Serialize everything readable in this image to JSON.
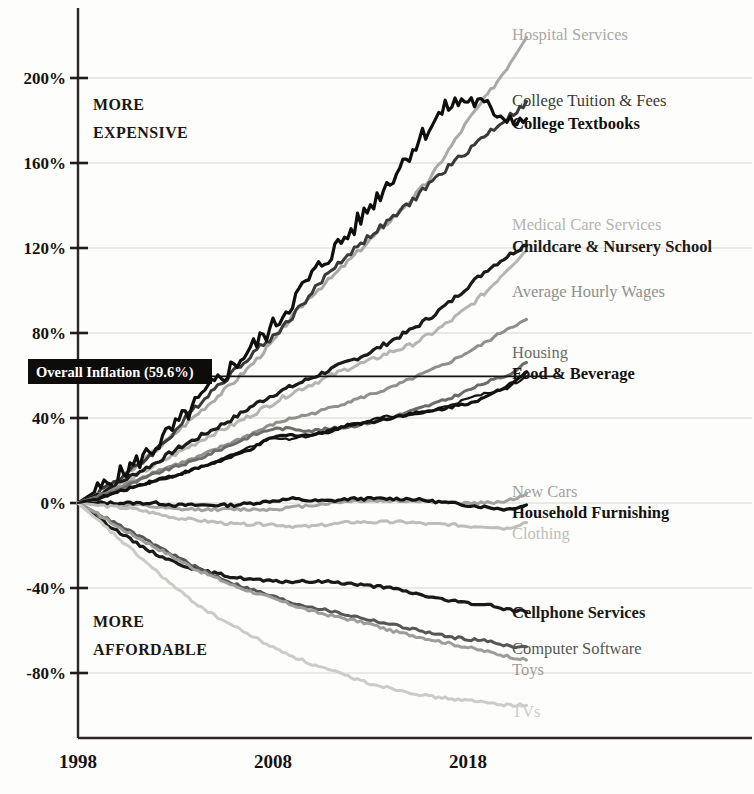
{
  "chart_data": {
    "type": "line",
    "title": "",
    "subtitle": "",
    "xlabel": "",
    "ylabel": "",
    "xlim": [
      1998,
      2021
    ],
    "ylim": [
      -100,
      225
    ],
    "grid": true,
    "legend_position": "right-inline-labels",
    "x_ticks": [
      "1998",
      "2008",
      "2018"
    ],
    "x_tick_values": [
      1998,
      2008,
      2018
    ],
    "y_ticks": [
      "200%",
      "160%",
      "120%",
      "80%",
      "40%",
      "0%",
      "-40%",
      "-80%"
    ],
    "y_tick_values": [
      200,
      160,
      120,
      80,
      40,
      0,
      -40,
      -80
    ],
    "annotations": [
      {
        "name": "more-expensive",
        "text_line1": "MORE",
        "text_line2": "EXPENSIVE"
      },
      {
        "name": "more-affordable",
        "text_line1": "MORE",
        "text_line2": "AFFORDABLE"
      },
      {
        "name": "overall-inflation",
        "text": "Overall Inflation (59.6%)",
        "value": 59.6
      }
    ],
    "x": [
      1998,
      1999,
      2000,
      2001,
      2002,
      2003,
      2004,
      2005,
      2006,
      2007,
      2008,
      2009,
      2010,
      2011,
      2012,
      2013,
      2014,
      2015,
      2016,
      2017,
      2018,
      2019,
      2020,
      2021
    ],
    "series": [
      {
        "name": "Hospital Services",
        "label": "Hospital Services",
        "color": "#a9a9a6",
        "weight": "normal",
        "end_value": 220,
        "values": [
          0,
          5,
          10,
          17,
          25,
          33,
          41,
          49,
          57,
          66,
          76,
          88,
          98,
          106,
          115,
          124,
          133,
          142,
          152,
          166,
          180,
          192,
          205,
          220
        ]
      },
      {
        "name": "College Tuition & Fees",
        "label": "College Tuition & Fees",
        "color": "#3c3a38",
        "weight": "normal",
        "end_value": 188,
        "values": [
          0,
          5,
          11,
          17,
          25,
          34,
          45,
          54,
          62,
          71,
          78,
          88,
          99,
          110,
          118,
          126,
          133,
          141,
          150,
          158,
          166,
          174,
          181,
          188
        ]
      },
      {
        "name": "College Textbooks",
        "label": "College Textbooks",
        "color": "#100f0e",
        "weight": "bold",
        "end_value": 180,
        "values": [
          0,
          6,
          12,
          19,
          27,
          36,
          46,
          56,
          65,
          74,
          83,
          95,
          107,
          118,
          128,
          140,
          152,
          165,
          177,
          187,
          190,
          186,
          182,
          180
        ]
      },
      {
        "name": "Medical Care Services",
        "label": "Medical Care Services",
        "color": "#b5b5b2",
        "weight": "normal",
        "end_value": 119,
        "values": [
          0,
          4,
          8,
          13,
          18,
          23,
          28,
          33,
          37,
          42,
          47,
          52,
          56,
          60,
          64,
          67,
          71,
          74,
          79,
          85,
          92,
          100,
          110,
          119
        ]
      },
      {
        "name": "Childcare & Nursery School",
        "label": "Childcare & Nursery School",
        "color": "#1d1b19",
        "weight": "bold",
        "end_value": 122,
        "values": [
          0,
          4,
          9,
          14,
          19,
          25,
          30,
          35,
          40,
          46,
          51,
          55,
          59,
          63,
          67,
          71,
          76,
          81,
          87,
          94,
          102,
          110,
          116,
          122
        ]
      },
      {
        "name": "Average Hourly Wages",
        "label": "Average Hourly Wages",
        "color": "#8f8f8c",
        "weight": "normal",
        "end_value": 86,
        "values": [
          0,
          3,
          7,
          11,
          15,
          18,
          21,
          25,
          29,
          33,
          37,
          40,
          42,
          45,
          48,
          51,
          54,
          58,
          62,
          66,
          71,
          76,
          82,
          86
        ]
      },
      {
        "name": "Housing",
        "label": "Housing",
        "color": "#6e6c69",
        "weight": "normal",
        "end_value": 66,
        "values": [
          0,
          3,
          6,
          10,
          14,
          17,
          20,
          24,
          28,
          32,
          35,
          35,
          34,
          35,
          36,
          38,
          40,
          43,
          46,
          49,
          53,
          57,
          60,
          66
        ]
      },
      {
        "name": "Food & Beverage",
        "label": "Food & Beverage",
        "color": "#141312",
        "weight": "bold",
        "end_value": 62,
        "values": [
          0,
          2,
          5,
          8,
          11,
          13,
          16,
          19,
          22,
          26,
          31,
          32,
          32,
          34,
          37,
          38,
          40,
          42,
          43,
          45,
          47,
          50,
          55,
          62
        ]
      },
      {
        "name": "Overall Inflation",
        "label": "Overall Inflation (59.6%)",
        "color": "#141312",
        "weight": "normal",
        "end_value": 59.6,
        "values": [
          0,
          2,
          5,
          8,
          10,
          13,
          16,
          19,
          23,
          27,
          31,
          30,
          32,
          35,
          37,
          39,
          41,
          41,
          43,
          46,
          49,
          52,
          54,
          59.6
        ]
      },
      {
        "name": "New Cars",
        "label": "New Cars",
        "color": "#a3a3a0",
        "weight": "normal",
        "end_value": 4,
        "values": [
          0,
          0,
          -1,
          -1,
          -2,
          -3,
          -3,
          -3,
          -3,
          -3,
          -3,
          -2,
          -1,
          0,
          1,
          1,
          1,
          1,
          1,
          0,
          0,
          0,
          1,
          4
        ]
      },
      {
        "name": "Household Furnishing",
        "label": "Household Furnishing",
        "color": "#151413",
        "weight": "bold",
        "end_value": -1,
        "values": [
          0,
          0,
          0,
          0,
          0,
          -1,
          -1,
          -1,
          -1,
          0,
          1,
          2,
          1,
          1,
          2,
          2,
          2,
          2,
          1,
          0,
          -1,
          -2,
          -3,
          -1
        ]
      },
      {
        "name": "Clothing",
        "label": "Clothing",
        "color": "#bdbdba",
        "weight": "normal",
        "end_value": -9,
        "values": [
          0,
          -1,
          -2,
          -3,
          -5,
          -7,
          -8,
          -9,
          -10,
          -10,
          -10,
          -11,
          -11,
          -10,
          -9,
          -9,
          -9,
          -9,
          -10,
          -10,
          -11,
          -11,
          -12,
          -9
        ]
      },
      {
        "name": "Cellphone Services",
        "label": "Cellphone Services",
        "color": "#1b1a18",
        "weight": "bold",
        "end_value": -51,
        "values": [
          0,
          -7,
          -13,
          -19,
          -24,
          -28,
          -31,
          -33,
          -35,
          -36,
          -37,
          -37,
          -37,
          -37,
          -38,
          -39,
          -40,
          -42,
          -44,
          -46,
          -47,
          -48,
          -50,
          -51
        ]
      },
      {
        "name": "Computer Software",
        "label": "Computer Software",
        "color": "#585654",
        "weight": "normal",
        "end_value": -68,
        "values": [
          0,
          -5,
          -10,
          -15,
          -20,
          -25,
          -30,
          -34,
          -38,
          -41,
          -44,
          -47,
          -49,
          -51,
          -53,
          -55,
          -57,
          -59,
          -61,
          -63,
          -64,
          -65,
          -67,
          -68
        ]
      },
      {
        "name": "Toys",
        "label": "Toys",
        "color": "#9d9d9a",
        "weight": "normal",
        "end_value": -74,
        "values": [
          0,
          -5,
          -11,
          -16,
          -21,
          -26,
          -31,
          -35,
          -39,
          -42,
          -45,
          -48,
          -51,
          -53,
          -55,
          -57,
          -60,
          -62,
          -64,
          -66,
          -68,
          -70,
          -72,
          -74
        ]
      },
      {
        "name": "TVs",
        "label": "TVs",
        "color": "#cbcbc8",
        "weight": "normal",
        "end_value": -95,
        "values": [
          0,
          -8,
          -16,
          -24,
          -32,
          -40,
          -47,
          -53,
          -58,
          -63,
          -68,
          -72,
          -76,
          -79,
          -82,
          -85,
          -87,
          -89,
          -91,
          -92,
          -93,
          -94,
          -95,
          -95
        ]
      }
    ],
    "label_placements": [
      {
        "series": "Hospital Services",
        "y": 40,
        "x": 512,
        "bold": false,
        "color": "#a9a9a6"
      },
      {
        "series": "College Tuition & Fees",
        "y": 106,
        "x": 512,
        "bold": false,
        "color": "#3c3a38"
      },
      {
        "series": "College Textbooks",
        "y": 129,
        "x": 512,
        "bold": true,
        "color": "#100f0e"
      },
      {
        "series": "Medical Care Services",
        "y": 230,
        "x": 512,
        "bold": false,
        "color": "#b5b5b2"
      },
      {
        "series": "Childcare & Nursery School",
        "y": 252,
        "x": 512,
        "bold": true,
        "color": "#1d1b19"
      },
      {
        "series": "Average Hourly Wages",
        "y": 297,
        "x": 512,
        "bold": false,
        "color": "#8f8f8c"
      },
      {
        "series": "Housing",
        "y": 358,
        "x": 512,
        "bold": false,
        "color": "#6e6c69"
      },
      {
        "series": "Food & Beverage",
        "y": 379,
        "x": 512,
        "bold": true,
        "color": "#141312"
      },
      {
        "series": "New Cars",
        "y": 497,
        "x": 512,
        "bold": false,
        "color": "#a3a3a0"
      },
      {
        "series": "Household Furnishing",
        "y": 518,
        "x": 512,
        "bold": true,
        "color": "#151413"
      },
      {
        "series": "Clothing",
        "y": 539,
        "x": 512,
        "bold": false,
        "color": "#bdbdba"
      },
      {
        "series": "Cellphone Services",
        "y": 618,
        "x": 512,
        "bold": true,
        "color": "#1b1a18"
      },
      {
        "series": "Computer Software",
        "y": 654,
        "x": 512,
        "bold": false,
        "color": "#585654"
      },
      {
        "series": "Toys",
        "y": 675,
        "x": 512,
        "bold": false,
        "color": "#9d9d9a"
      },
      {
        "series": "TVs",
        "y": 717,
        "x": 512,
        "bold": false,
        "color": "#cbcbc8"
      }
    ]
  }
}
